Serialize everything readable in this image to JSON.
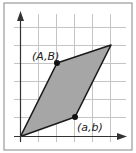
{
  "diagram": {
    "type": "parallelogram-on-grid",
    "labels": {
      "point_upper": "(A,B)",
      "point_lower": "(a,b)"
    },
    "points_grid": {
      "origin": [
        0,
        0
      ],
      "A_B": [
        2,
        4
      ],
      "a_b": [
        3,
        1
      ],
      "sum": [
        5,
        5
      ]
    },
    "colors": {
      "fill": "#a6a6a6",
      "stroke": "#1a1a1a",
      "grid": "#c4c4c4",
      "frame": "#9a9a9a"
    }
  }
}
